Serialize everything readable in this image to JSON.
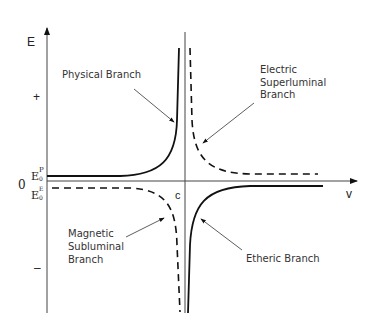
{
  "axes": {
    "y_label": "E",
    "x_label": "v",
    "origin_label": "0",
    "c_label": "c",
    "plus_label": "+",
    "minus_label": "–",
    "ep_main": "E",
    "ep_sup": "P",
    "ep_sub": "0",
    "ee_main": "E",
    "ee_sup": "E",
    "ee_sub": "0"
  },
  "branches": {
    "physical": {
      "line1": "Physical Branch",
      "style": "solid"
    },
    "electric": {
      "line1": "Electric",
      "line2": "Superluminal",
      "line3": "Branch",
      "style": "dashed"
    },
    "magnetic": {
      "line1": "Magnetic",
      "line2": "Subluminal",
      "line3": "Branch",
      "style": "dashed"
    },
    "etheric": {
      "line1": "Etheric Branch",
      "style": "solid"
    }
  }
}
